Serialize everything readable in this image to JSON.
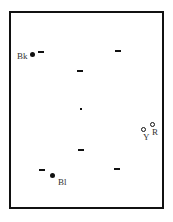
{
  "diagram": {
    "type": "table-top-view",
    "frame_color": "#111111",
    "background_color": "#ffffff",
    "balls": [
      {
        "id": "black",
        "label": "Bk",
        "style": "filled"
      },
      {
        "id": "blue",
        "label": "Bl",
        "style": "filled"
      },
      {
        "id": "yellow",
        "label": "Y",
        "style": "ring"
      },
      {
        "id": "red",
        "label": "R",
        "style": "ring"
      }
    ],
    "spot_markers": [
      {
        "position": "upper-left"
      },
      {
        "position": "upper-right"
      },
      {
        "position": "upper-center"
      },
      {
        "position": "center",
        "style": "dot"
      },
      {
        "position": "lower-center"
      },
      {
        "position": "lower-left"
      },
      {
        "position": "lower-right"
      }
    ]
  }
}
